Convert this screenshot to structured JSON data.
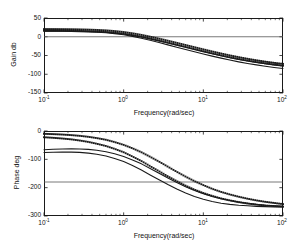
{
  "figure": {
    "kind": "bode-plot",
    "background": "#ffffff",
    "line_color": "#1a1a1a",
    "axis_color": "#1a1a1a",
    "reference_line_color": "#555555"
  },
  "chart_data": [
    {
      "type": "line",
      "id": "gain-panel",
      "title": "",
      "xlabel": "Frequency(rad/sec)",
      "ylabel": "Gain db",
      "xscale": "log",
      "xlim": [
        0.1,
        100
      ],
      "ylim": [
        -150,
        50
      ],
      "yticks": [
        50,
        0,
        -50,
        -100,
        -150
      ],
      "ytick_labels": [
        "50",
        "0",
        "-50",
        "-100",
        "-150"
      ],
      "xticks": [
        0.1,
        1,
        10,
        100
      ],
      "xtick_labels": [
        "10-1",
        "10 0",
        "10 1",
        "10 2"
      ],
      "xtick_mantissa": [
        "10",
        "10",
        "10",
        "10"
      ],
      "xtick_exponent": [
        "-1",
        "0",
        "1",
        "2"
      ],
      "grid": false,
      "legend": "none",
      "annotations": [
        {
          "type": "hline",
          "y": 0,
          "label": "0 dB reference"
        }
      ],
      "x": [
        0.1,
        0.13,
        0.17,
        0.22,
        0.28,
        0.36,
        0.46,
        0.6,
        0.77,
        1.0,
        1.29,
        1.67,
        2.15,
        2.78,
        3.59,
        4.64,
        5.99,
        7.74,
        10.0,
        12.9,
        16.7,
        21.5,
        27.8,
        35.9,
        46.4,
        59.9,
        77.4,
        100.0
      ],
      "series": [
        {
          "name": "dotted-upper",
          "style": "dotted",
          "values": [
            20.5,
            20.4,
            20.2,
            20.0,
            19.6,
            19.0,
            18.2,
            17.0,
            15.2,
            12.6,
            9.2,
            5.0,
            0.2,
            -5.0,
            -10.5,
            -16.2,
            -22.0,
            -27.8,
            -33.6,
            -39.2,
            -44.6,
            -49.7,
            -54.4,
            -58.8,
            -62.8,
            -66.4,
            -69.6,
            -72.4
          ]
        },
        {
          "name": "dotted-lower",
          "style": "dotted",
          "values": [
            16.5,
            16.4,
            16.2,
            15.9,
            15.5,
            14.9,
            14.0,
            12.7,
            10.8,
            8.1,
            4.5,
            0.2,
            -4.7,
            -10.0,
            -15.6,
            -21.3,
            -27.1,
            -32.9,
            -38.6,
            -44.2,
            -49.6,
            -54.6,
            -59.3,
            -63.6,
            -67.5,
            -71.0,
            -74.2,
            -77.0
          ]
        },
        {
          "name": "solid-upper",
          "style": "solid",
          "values": [
            15.8,
            15.7,
            15.5,
            15.2,
            14.8,
            14.1,
            13.2,
            11.9,
            10.0,
            7.3,
            3.7,
            -0.7,
            -5.6,
            -11.0,
            -16.6,
            -22.4,
            -28.2,
            -34.0,
            -39.7,
            -45.3,
            -50.7,
            -55.8,
            -60.5,
            -64.8,
            -68.7,
            -72.2,
            -75.4,
            -78.2
          ]
        },
        {
          "name": "solid-lower",
          "style": "solid",
          "values": [
            15.0,
            14.9,
            14.6,
            14.3,
            13.8,
            13.0,
            12.0,
            10.5,
            8.3,
            5.2,
            1.1,
            -3.9,
            -9.5,
            -15.5,
            -21.6,
            -27.8,
            -34.0,
            -40.0,
            -45.9,
            -51.6,
            -57.1,
            -62.2,
            -66.9,
            -71.2,
            -75.1,
            -78.6,
            -81.8,
            -84.6
          ]
        }
      ]
    },
    {
      "type": "line",
      "id": "phase-panel",
      "title": "",
      "xlabel": "Frequency(rad/sec)",
      "ylabel": "Phase deg",
      "xscale": "log",
      "xlim": [
        0.1,
        100
      ],
      "ylim": [
        -300,
        0
      ],
      "yticks": [
        0,
        -100,
        -200,
        -300
      ],
      "ytick_labels": [
        "0",
        "-100",
        "-200",
        "-300"
      ],
      "xticks": [
        0.1,
        1,
        10,
        100
      ],
      "xtick_labels": [
        "10-1",
        "10 0",
        "10 1",
        "10 2"
      ],
      "xtick_mantissa": [
        "10",
        "10",
        "10",
        "10"
      ],
      "xtick_exponent": [
        "-1",
        "0",
        "1",
        "2"
      ],
      "grid": false,
      "legend": "none",
      "annotations": [
        {
          "type": "hline",
          "y": -180,
          "label": "-180 deg reference"
        }
      ],
      "x": [
        0.1,
        0.13,
        0.17,
        0.22,
        0.28,
        0.36,
        0.46,
        0.6,
        0.77,
        1.0,
        1.29,
        1.67,
        2.15,
        2.78,
        3.59,
        4.64,
        5.99,
        7.74,
        10.0,
        12.9,
        16.7,
        21.5,
        27.8,
        35.9,
        46.4,
        59.9,
        77.4,
        100.0
      ],
      "series": [
        {
          "name": "dotted-upper",
          "style": "dotted",
          "values": [
            -10.0,
            -11.0,
            -12.5,
            -14.5,
            -17.0,
            -20.5,
            -25.0,
            -31.0,
            -39.0,
            -49.0,
            -61.0,
            -75.0,
            -91.0,
            -108.0,
            -126.0,
            -144.0,
            -161.0,
            -177.0,
            -191.0,
            -204.0,
            -215.0,
            -224.0,
            -232.0,
            -239.0,
            -245.0,
            -250.0,
            -254.0,
            -258.0
          ]
        },
        {
          "name": "dotted-lower",
          "style": "dotted",
          "values": [
            -22.0,
            -24.0,
            -26.5,
            -29.5,
            -33.5,
            -38.5,
            -45.0,
            -53.0,
            -63.0,
            -75.0,
            -90.0,
            -106.0,
            -124.0,
            -142.0,
            -160.0,
            -177.0,
            -193.0,
            -207.0,
            -219.0,
            -229.0,
            -238.0,
            -245.0,
            -251.0,
            -256.0,
            -260.0,
            -263.0,
            -265.0,
            -267.0
          ]
        },
        {
          "name": "solid-upper",
          "style": "solid",
          "values": [
            -66.0,
            -64.5,
            -63.5,
            -63.0,
            -63.5,
            -65.0,
            -68.0,
            -73.0,
            -80.0,
            -90.0,
            -102.0,
            -116.0,
            -132.0,
            -149.0,
            -166.0,
            -182.0,
            -197.0,
            -210.0,
            -221.0,
            -231.0,
            -239.0,
            -245.0,
            -251.0,
            -255.0,
            -259.0,
            -262.0,
            -264.0,
            -266.0
          ]
        },
        {
          "name": "solid-lower",
          "style": "solid",
          "values": [
            -76.0,
            -75.0,
            -74.5,
            -74.5,
            -75.5,
            -78.0,
            -82.0,
            -88.0,
            -97.0,
            -108.0,
            -122.0,
            -138.0,
            -155.0,
            -172.0,
            -189.0,
            -205.0,
            -219.0,
            -231.0,
            -241.0,
            -249.0,
            -255.0,
            -259.0,
            -262.0,
            -264.0,
            -266.0,
            -267.0,
            -268.0,
            -268.0
          ]
        }
      ]
    }
  ]
}
